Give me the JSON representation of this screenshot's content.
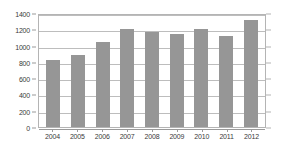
{
  "chart_data": {
    "type": "bar",
    "title": "",
    "subtitle": "",
    "xlabel": "",
    "ylabel": "",
    "categories": [
      "2004",
      "2005",
      "2006",
      "2007",
      "2008",
      "2009",
      "2010",
      "2011",
      "2012"
    ],
    "values": [
      820,
      885,
      1045,
      1205,
      1165,
      1140,
      1205,
      1120,
      1320
    ],
    "series": [
      {
        "name": "",
        "values": [
          820,
          885,
          1045,
          1205,
          1165,
          1140,
          1205,
          1120,
          1320
        ]
      }
    ],
    "ylim": [
      0,
      1400
    ],
    "ytick_step": 200,
    "yticks": [
      0,
      200,
      400,
      600,
      800,
      1000,
      1200,
      1400
    ],
    "ytick_labels": [
      "0",
      "200",
      "400",
      "600",
      "800",
      "1000",
      "1200",
      "1400"
    ],
    "xtick_labels": [
      "2004",
      "2005",
      "2006",
      "2007",
      "2008",
      "2009",
      "2010",
      "2011",
      "2012"
    ],
    "grid": true,
    "grid_axis": "y",
    "legend": false,
    "legend_position": "none",
    "annotations": [],
    "colors": {
      "bar": "#969696",
      "grid": "#bdbdbd",
      "axis": "#9a9a9a",
      "border": "#b4b4b4",
      "text": "#3a3a3a",
      "background": "#ffffff"
    }
  }
}
